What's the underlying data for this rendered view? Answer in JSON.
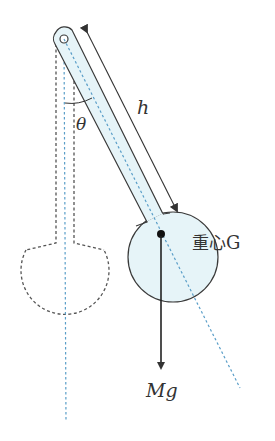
{
  "diagram": {
    "type": "physical-pendulum",
    "labels": {
      "angle": "θ",
      "length": "h",
      "center_of_mass_cjk": "重心",
      "center_of_mass_suffix": "G",
      "force": "Mg"
    },
    "colors": {
      "outline": "#3a3a3a",
      "fill": "#e6f4f8",
      "axis_line": "#5a9ec8",
      "dashed_outline": "#555555",
      "text": "#333333"
    },
    "geometry": {
      "pivot": [
        64,
        39
      ],
      "center_of_mass": [
        161,
        234
      ],
      "bob_center": [
        173,
        257
      ],
      "bob_radius": 45,
      "rest_bob_center": [
        66,
        310
      ],
      "rest_bob_radius": 45
    }
  }
}
